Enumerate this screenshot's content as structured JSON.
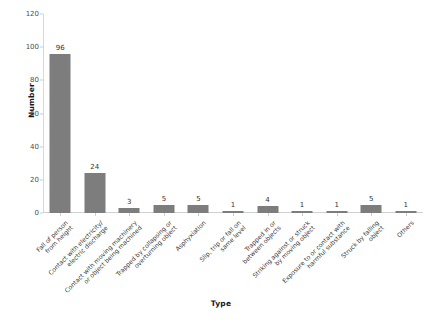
{
  "chart_data": {
    "type": "bar",
    "title": "",
    "xlabel": "Type",
    "ylabel": "Number",
    "ylim": [
      0,
      120
    ],
    "yticks": [
      0,
      20,
      40,
      60,
      80,
      100,
      120
    ],
    "grid": false,
    "legend": "none",
    "bar_color": "#7d7d7d",
    "categories": [
      "Fall of person\nfrom height",
      "Contact with electricity/\nelectric discharge",
      "Contact with moving machinery\nor object being machined",
      "Trapped by collapsing or\noverturning object",
      "Asphyxiation",
      "Slip, trip or fall on\nsame level",
      "Trapped in or\nbetween objects",
      "Striking against or struck\nby moving object",
      "Exposure to or contact with\nharmful substance",
      "Struck by falling\nobject",
      "Others"
    ],
    "values": [
      96,
      24,
      3,
      5,
      5,
      1,
      4,
      1,
      1,
      5,
      1
    ],
    "value_labels": [
      "96",
      "24",
      "3",
      "5",
      "5",
      "1",
      "4",
      "1",
      "1",
      "5",
      "1"
    ]
  }
}
